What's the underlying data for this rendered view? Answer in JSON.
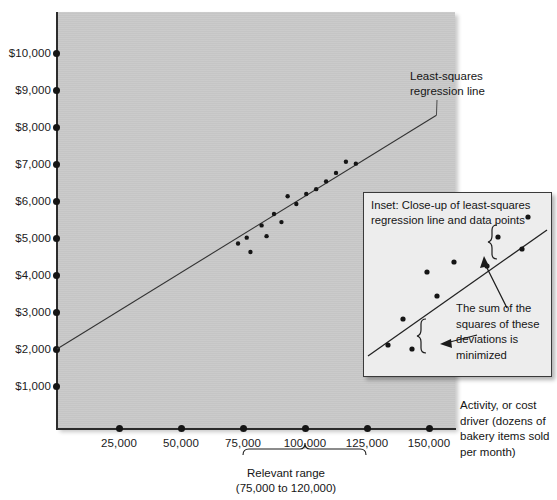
{
  "chart_data": {
    "type": "scatter",
    "title": "",
    "xlabel": "Activity, or cost driver (dozens of bakery items sold per month)",
    "ylabel": "",
    "xlim": [
      0,
      162500
    ],
    "ylim": [
      0,
      10600
    ],
    "grid": false,
    "legend": "none",
    "x_ticks": [
      25000,
      50000,
      75000,
      100000,
      125000,
      150000
    ],
    "x_tick_labels": [
      "25,000",
      "50,000",
      "75,000",
      "100,000",
      "125,000",
      "150,000"
    ],
    "y_ticks": [
      1000,
      2000,
      3000,
      4000,
      5000,
      6000,
      7000,
      8000,
      9000,
      10000
    ],
    "y_tick_labels": [
      "$1,000",
      "$2,000",
      "$3,000",
      "$4,000",
      "$5,000",
      "$6,000",
      "$7,000",
      "$8,000",
      "$9,000",
      "$10,000"
    ],
    "regression_line": {
      "name": "Least-squares regression line",
      "intercept": 2000,
      "slope": 0.0413,
      "x_start": 0,
      "x_end": 153000
    },
    "points": [
      {
        "x": 73000,
        "y": 4850
      },
      {
        "x": 76500,
        "y": 5010
      },
      {
        "x": 78000,
        "y": 4620
      },
      {
        "x": 82500,
        "y": 5340
      },
      {
        "x": 84500,
        "y": 5050
      },
      {
        "x": 87500,
        "y": 5650
      },
      {
        "x": 90500,
        "y": 5430
      },
      {
        "x": 93000,
        "y": 6130
      },
      {
        "x": 96500,
        "y": 5920
      },
      {
        "x": 100500,
        "y": 6190
      },
      {
        "x": 104500,
        "y": 6320
      },
      {
        "x": 108500,
        "y": 6530
      },
      {
        "x": 112500,
        "y": 6760
      },
      {
        "x": 116500,
        "y": 7060
      },
      {
        "x": 120500,
        "y": 7010
      }
    ],
    "annotations": [
      {
        "name": "regression-line-callout",
        "text": "Least-squares regression line"
      },
      {
        "name": "relevant-range-bracket",
        "text": "Relevant range (75,000 to 120,000)",
        "from": 75000,
        "to": 125000
      }
    ]
  },
  "axis": {
    "y_labels": [
      "$10,000",
      "$9,000",
      "$8,000",
      "$7,000",
      "$6,000",
      "$5,000",
      "$4,000",
      "$3,000",
      "$2,000",
      "$1,000"
    ],
    "x_labels": [
      "25,000",
      "50,000",
      "75,000",
      "100,000",
      "125,000",
      "150,000"
    ],
    "caption": "Activity, or cost driver (dozens of bakery items sold per month)"
  },
  "annotations": {
    "lsq_line_1": "Least-squares",
    "lsq_line_2": "regression line",
    "relevant_range_1": "Relevant range",
    "relevant_range_2": "(75,000 to 120,000)"
  },
  "inset": {
    "title_line_1": "Inset: Close-up of least-squares",
    "title_line_2": "regression line and data points",
    "note_line_1": "The sum of the",
    "note_line_2": "squares of these",
    "note_line_3": "deviations is",
    "note_line_4": "minimized",
    "points": [
      {
        "x": 24,
        "y": 152
      },
      {
        "x": 48,
        "y": 156
      },
      {
        "x": 39,
        "y": 126
      },
      {
        "x": 73,
        "y": 103
      },
      {
        "x": 63,
        "y": 79
      },
      {
        "x": 90,
        "y": 69
      },
      {
        "x": 123,
        "y": 73
      },
      {
        "x": 134,
        "y": 44
      },
      {
        "x": 158,
        "y": 56
      },
      {
        "x": 164,
        "y": 24
      }
    ],
    "line": {
      "x1": 4,
      "y1": 163,
      "x2": 183,
      "y2": 37
    }
  },
  "colors": {
    "plot_background": "#c9c9c9",
    "axis": "#2c2c2c",
    "point": "#151515",
    "inset_background": "#ededed",
    "inset_border": "#3a3a3a",
    "text": "#151515"
  }
}
